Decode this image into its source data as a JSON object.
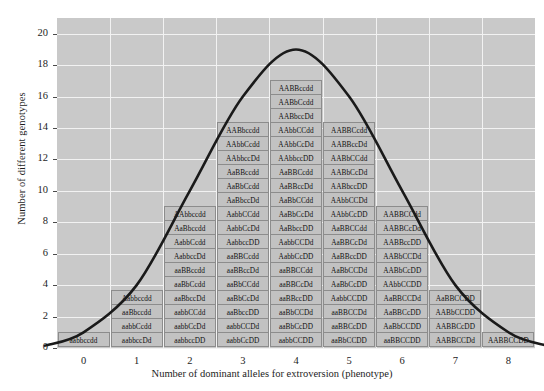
{
  "chart_data": {
    "type": "bar",
    "title": "",
    "xlabel": "Number of dominant alleles for extroversion (phenotype)",
    "ylabel": "Number of different genotypes",
    "categories": [
      "0",
      "1",
      "2",
      "3",
      "4",
      "5",
      "6",
      "7",
      "8"
    ],
    "values": [
      1,
      4,
      10,
      15,
      19,
      15,
      10,
      4,
      1
    ],
    "xlim": [
      -0.5,
      8.5
    ],
    "ylim": [
      0,
      21
    ],
    "yticks": [
      0,
      2,
      4,
      6,
      8,
      10,
      12,
      14,
      16,
      18,
      20
    ],
    "xticks": [
      "0",
      "1",
      "2",
      "3",
      "4",
      "5",
      "6",
      "7",
      "8"
    ],
    "grid": true,
    "legend": "none",
    "overlay_curve": "normal distribution bell curve",
    "colors": {
      "plot_background": "#c9c9c9",
      "gridline": "#f2f2f2",
      "cell_fill": "#c2c2c2",
      "cell_border": "#8c8c8c",
      "curve": "#1a1a1a",
      "text": "#1d1d1d"
    },
    "columns": [
      {
        "x": "0",
        "count": 1,
        "genotypes": [
          "aabbccdd"
        ]
      },
      {
        "x": "1",
        "count": 4,
        "genotypes": [
          "Aabbccdd",
          "aaBbccdd",
          "aabbCcdd",
          "aabbccDd"
        ]
      },
      {
        "x": "2",
        "count": 10,
        "genotypes": [
          "AAbbccdd",
          "AaBbccdd",
          "AabbCcdd",
          "AabbccDd",
          "aaBBccdd",
          "aaBbCcdd",
          "aaBbccDd",
          "aabbCCdd",
          "aabbCcDd",
          "aabbccDD"
        ]
      },
      {
        "x": "3",
        "count": 15,
        "genotypes": [
          "AABbccdd",
          "AAbbCcdd",
          "AAbbccDd",
          "AaBBccdd",
          "AaBbCcdd",
          "AaBbccDd",
          "AabbCCdd",
          "AabbCcDd",
          "AabbccDD",
          "aaBBCcdd",
          "aaBBccDd",
          "aaBbCCdd",
          "aaBbCcDd",
          "aaBbccDD",
          "aabbCCDd",
          "aabbCcDD"
        ]
      },
      {
        "x": "4",
        "count": 19,
        "genotypes": [
          "AABBccdd",
          "AABbCcdd",
          "AABbccDd",
          "AAbbCCdd",
          "AAbbCcDd",
          "AAbbccDD",
          "AaBBCcdd",
          "AaBBccDd",
          "AaBbCCdd",
          "AaBbCcDd",
          "AaBbccDD",
          "AabbCCDd",
          "AabbCcDD",
          "aaBBCCdd",
          "aaBBCcDd",
          "aaBBccDD",
          "aaBbCCDd",
          "aaBbCcDD",
          "aabbCCDD"
        ]
      },
      {
        "x": "5",
        "count": 15,
        "genotypes": [
          "AABBCcdd",
          "AABBccDd",
          "AABbCCdd",
          "AABbCcDd",
          "AABbccDD",
          "AAbbCCDd",
          "AAbbCcDD",
          "AaBBCCdd",
          "AaBBCcDd",
          "AaBBccDD",
          "AaBbCCDd",
          "AaBbCcDD",
          "AabbCCDD",
          "aaBBCCDd",
          "aaBBCcDD",
          "aaBbCCDD"
        ]
      },
      {
        "x": "6",
        "count": 10,
        "genotypes": [
          "AABBCCdd",
          "AABBCcDd",
          "AABBccDD",
          "AABbCCDd",
          "AABbCcDD",
          "AAbbCCDD",
          "AaBBCCDd",
          "AaBBCcDD",
          "AaBbCCDD",
          "aaBBCCDD"
        ]
      },
      {
        "x": "7",
        "count": 4,
        "genotypes": [
          "AaBBCCDD",
          "AABbCCDD",
          "AABBCcDD",
          "AABBCCDd"
        ]
      },
      {
        "x": "8",
        "count": 1,
        "genotypes": [
          "AABBCCDD"
        ]
      }
    ]
  },
  "axis": {
    "y_title": "Number of different genotypes",
    "x_title": "Number of dominant alleles for extroversion (phenotype)",
    "y_ticks": [
      "20",
      "18",
      "16",
      "14",
      "12",
      "10",
      "8",
      "6",
      "4",
      "2",
      "0"
    ],
    "x_ticks": [
      "0",
      "1",
      "2",
      "3",
      "4",
      "5",
      "6",
      "7",
      "8"
    ]
  }
}
